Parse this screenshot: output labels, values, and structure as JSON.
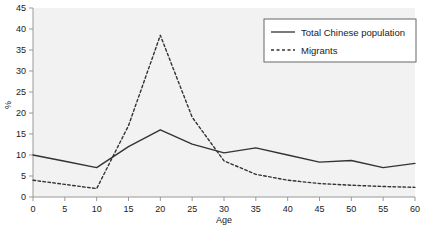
{
  "chart_data": {
    "type": "line",
    "title": "",
    "xlabel": "Age",
    "ylabel": "%",
    "xlim": [
      0,
      60
    ],
    "ylim": [
      0,
      45
    ],
    "xticks": [
      0,
      5,
      10,
      15,
      20,
      25,
      30,
      35,
      40,
      45,
      50,
      55,
      60
    ],
    "yticks": [
      0,
      5,
      10,
      15,
      20,
      25,
      30,
      35,
      40,
      45
    ],
    "grid": false,
    "legend_position": "top-right",
    "x": [
      0,
      5,
      10,
      15,
      20,
      25,
      30,
      35,
      40,
      45,
      50,
      55,
      60
    ],
    "series": [
      {
        "name": "Total Chinese population",
        "style": "solid",
        "color": "#333333",
        "values": [
          10.0,
          8.5,
          7.0,
          12.0,
          16.0,
          12.6,
          10.5,
          11.7,
          10.0,
          8.3,
          8.7,
          7.0,
          8.0
        ]
      },
      {
        "name": "Migrants",
        "style": "dashed",
        "color": "#333333",
        "values": [
          4.0,
          3.0,
          2.0,
          17.0,
          38.5,
          19.0,
          8.6,
          5.4,
          4.0,
          3.2,
          2.8,
          2.5,
          2.3
        ]
      }
    ]
  },
  "legend": {
    "items": [
      {
        "label": "Total Chinese population",
        "style": "solid"
      },
      {
        "label": "Migrants",
        "style": "dashed"
      }
    ]
  },
  "axes": {
    "x_label": "Age",
    "y_label": "%",
    "x_tick_labels": [
      "0",
      "5",
      "10",
      "15",
      "20",
      "25",
      "30",
      "35",
      "40",
      "45",
      "50",
      "55",
      "60"
    ],
    "y_tick_labels": [
      "0",
      "5",
      "10",
      "15",
      "20",
      "25",
      "30",
      "35",
      "40",
      "45"
    ]
  },
  "colors": {
    "plot_background": "#f2f2f2",
    "axis": "#999999",
    "line": "#333333",
    "text": "#1a1a1a",
    "legend_border": "#666666",
    "page_background": "#ffffff"
  }
}
